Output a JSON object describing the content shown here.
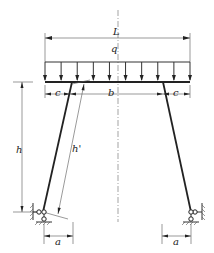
{
  "diagram": {
    "labels": {
      "span": "L",
      "load": "q",
      "inner_width": "b",
      "left_offset": "c",
      "right_offset": "c",
      "height": "h",
      "inclined_length": "h'",
      "left_base_offset": "a",
      "right_base_offset": "a"
    },
    "load_arrow_count": 10,
    "supports": [
      "pinned-left",
      "pinned-right"
    ]
  }
}
